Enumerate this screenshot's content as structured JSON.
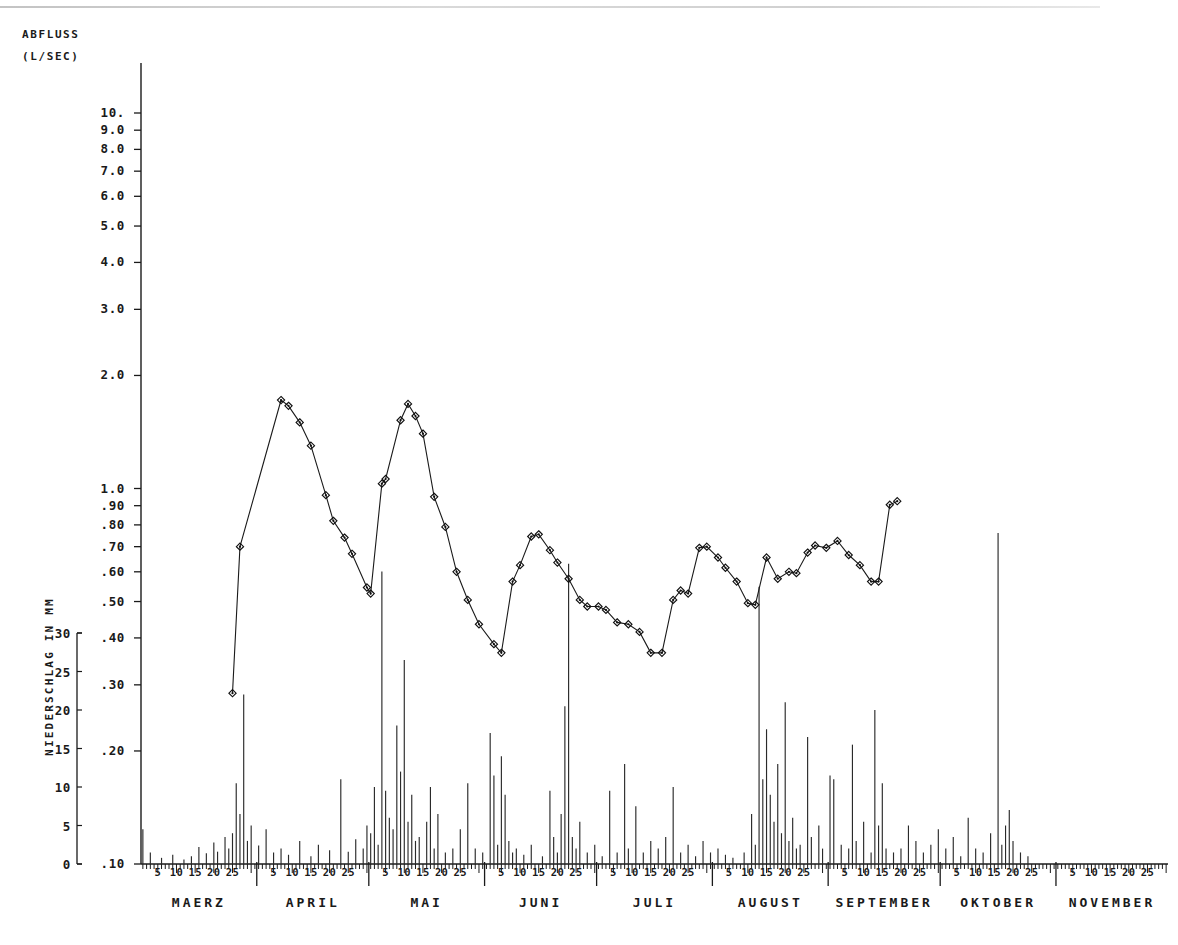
{
  "meta": {
    "kind": "hydrograph",
    "language": "de"
  },
  "axis_titles": {
    "discharge_line1": "ABFLUSS",
    "discharge_line2": "(L/SEC)",
    "precip_label": "NIEDERSCHLAG IN MM"
  },
  "chart_data": {
    "type": "line",
    "subtitle": "",
    "xlabel": "",
    "ylabel": "ABFLUSS (L/SEC)",
    "y2label": "NIEDERSCHLAG IN MM",
    "yscale": "log",
    "ylim": [
      0.1,
      10.0
    ],
    "y2lim": [
      0,
      30
    ],
    "grid": false,
    "legend": "none",
    "y_ticklabels": [
      "10.",
      "9.0",
      "8.0",
      "7.0",
      "6.0",
      "5.0",
      "4.0",
      "3.0",
      "2.0",
      "1.0",
      ".90",
      ".80",
      ".70",
      ".60",
      ".50",
      ".40",
      ".30",
      ".20",
      ".10"
    ],
    "y_tickvalues": [
      10.0,
      9.0,
      8.0,
      7.0,
      6.0,
      5.0,
      4.0,
      3.0,
      2.0,
      1.0,
      0.9,
      0.8,
      0.7,
      0.6,
      0.5,
      0.4,
      0.3,
      0.2,
      0.1
    ],
    "y2_ticklabels": [
      "30",
      "25",
      "20",
      "15",
      "10",
      "5",
      "0"
    ],
    "y2_tickvalues": [
      30,
      25,
      20,
      15,
      10,
      5,
      0
    ],
    "day_ticklabels": [
      "5",
      "10",
      "15",
      "20",
      "25"
    ],
    "months": [
      {
        "name": "MAERZ",
        "days": 31
      },
      {
        "name": "APRIL",
        "days": 30
      },
      {
        "name": "MAI",
        "days": 31
      },
      {
        "name": "JUNI",
        "days": 30
      },
      {
        "name": "JULI",
        "days": 31
      },
      {
        "name": "AUGUST",
        "days": 31
      },
      {
        "name": "SEPTEMBER",
        "days": 30
      },
      {
        "name": "OKTOBER",
        "days": 31
      },
      {
        "name": "NOVEMBER",
        "days": 30
      }
    ],
    "series": [
      {
        "name": "Abfluss",
        "unit": "l/sec",
        "marker": "diamond",
        "points": [
          {
            "day": 25,
            "value": 0.285
          },
          {
            "day": 27,
            "value": 0.7
          },
          {
            "day": 38,
            "value": 1.72
          },
          {
            "day": 40,
            "value": 1.66
          },
          {
            "day": 43,
            "value": 1.5
          },
          {
            "day": 46,
            "value": 1.3
          },
          {
            "day": 50,
            "value": 0.96
          },
          {
            "day": 52,
            "value": 0.82
          },
          {
            "day": 55,
            "value": 0.74
          },
          {
            "day": 57,
            "value": 0.67
          },
          {
            "day": 61,
            "value": 0.545
          },
          {
            "day": 62,
            "value": 0.525
          },
          {
            "day": 65,
            "value": 1.03
          },
          {
            "day": 66,
            "value": 1.06
          },
          {
            "day": 70,
            "value": 1.52
          },
          {
            "day": 72,
            "value": 1.68
          },
          {
            "day": 74,
            "value": 1.56
          },
          {
            "day": 76,
            "value": 1.4
          },
          {
            "day": 79,
            "value": 0.95
          },
          {
            "day": 82,
            "value": 0.79
          },
          {
            "day": 85,
            "value": 0.6
          },
          {
            "day": 88,
            "value": 0.505
          },
          {
            "day": 91,
            "value": 0.435
          },
          {
            "day": 95,
            "value": 0.385
          },
          {
            "day": 97,
            "value": 0.365
          },
          {
            "day": 100,
            "value": 0.565
          },
          {
            "day": 102,
            "value": 0.625
          },
          {
            "day": 105,
            "value": 0.745
          },
          {
            "day": 107,
            "value": 0.755
          },
          {
            "day": 110,
            "value": 0.685
          },
          {
            "day": 112,
            "value": 0.635
          },
          {
            "day": 115,
            "value": 0.575
          },
          {
            "day": 118,
            "value": 0.505
          },
          {
            "day": 120,
            "value": 0.485
          },
          {
            "day": 123,
            "value": 0.485
          },
          {
            "day": 125,
            "value": 0.475
          },
          {
            "day": 128,
            "value": 0.44
          },
          {
            "day": 131,
            "value": 0.435
          },
          {
            "day": 134,
            "value": 0.415
          },
          {
            "day": 137,
            "value": 0.365
          },
          {
            "day": 140,
            "value": 0.365
          },
          {
            "day": 143,
            "value": 0.505
          },
          {
            "day": 145,
            "value": 0.535
          },
          {
            "day": 147,
            "value": 0.525
          },
          {
            "day": 150,
            "value": 0.695
          },
          {
            "day": 152,
            "value": 0.7
          },
          {
            "day": 155,
            "value": 0.655
          },
          {
            "day": 157,
            "value": 0.615
          },
          {
            "day": 160,
            "value": 0.565
          },
          {
            "day": 163,
            "value": 0.495
          },
          {
            "day": 165,
            "value": 0.49
          },
          {
            "day": 168,
            "value": 0.655
          },
          {
            "day": 171,
            "value": 0.575
          },
          {
            "day": 174,
            "value": 0.6
          },
          {
            "day": 176,
            "value": 0.595
          },
          {
            "day": 179,
            "value": 0.675
          },
          {
            "day": 181,
            "value": 0.705
          },
          {
            "day": 184,
            "value": 0.695
          },
          {
            "day": 187,
            "value": 0.725
          },
          {
            "day": 190,
            "value": 0.665
          },
          {
            "day": 193,
            "value": 0.625
          },
          {
            "day": 196,
            "value": 0.565
          },
          {
            "day": 198,
            "value": 0.565
          },
          {
            "day": 201,
            "value": 0.905
          },
          {
            "day": 203,
            "value": 0.925
          }
        ]
      }
    ],
    "precipitation": {
      "name": "Niederschlag",
      "unit": "mm",
      "note": "daily bars; values above 30 mm are drawn beyond the top of the secondary axis",
      "bars": [
        {
          "day": 1,
          "value": 4.5
        },
        {
          "day": 3,
          "value": 1.5
        },
        {
          "day": 6,
          "value": 0.8
        },
        {
          "day": 9,
          "value": 1.2
        },
        {
          "day": 12,
          "value": 0.6
        },
        {
          "day": 14,
          "value": 1.0
        },
        {
          "day": 16,
          "value": 2.2
        },
        {
          "day": 18,
          "value": 1.4
        },
        {
          "day": 20,
          "value": 2.8
        },
        {
          "day": 21,
          "value": 1.6
        },
        {
          "day": 23,
          "value": 3.5
        },
        {
          "day": 24,
          "value": 2.0
        },
        {
          "day": 25,
          "value": 4.0
        },
        {
          "day": 26,
          "value": 10.5
        },
        {
          "day": 27,
          "value": 6.5
        },
        {
          "day": 28,
          "value": 22.0
        },
        {
          "day": 29,
          "value": 3.0
        },
        {
          "day": 30,
          "value": 5.0
        },
        {
          "day": 32,
          "value": 2.4
        },
        {
          "day": 34,
          "value": 4.5
        },
        {
          "day": 36,
          "value": 1.5
        },
        {
          "day": 38,
          "value": 2.0
        },
        {
          "day": 40,
          "value": 1.2
        },
        {
          "day": 43,
          "value": 3.0
        },
        {
          "day": 46,
          "value": 1.0
        },
        {
          "day": 48,
          "value": 2.5
        },
        {
          "day": 51,
          "value": 1.8
        },
        {
          "day": 54,
          "value": 11.0
        },
        {
          "day": 56,
          "value": 1.6
        },
        {
          "day": 58,
          "value": 3.2
        },
        {
          "day": 60,
          "value": 2.0
        },
        {
          "day": 61,
          "value": 5.0
        },
        {
          "day": 62,
          "value": 4.0
        },
        {
          "day": 63,
          "value": 10.0
        },
        {
          "day": 64,
          "value": 2.5
        },
        {
          "day": 65,
          "value": 38.0
        },
        {
          "day": 66,
          "value": 9.5
        },
        {
          "day": 67,
          "value": 6.0
        },
        {
          "day": 68,
          "value": 4.5
        },
        {
          "day": 69,
          "value": 18.0
        },
        {
          "day": 70,
          "value": 12.0
        },
        {
          "day": 71,
          "value": 26.5
        },
        {
          "day": 72,
          "value": 5.5
        },
        {
          "day": 73,
          "value": 9.0
        },
        {
          "day": 74,
          "value": 3.0
        },
        {
          "day": 75,
          "value": 3.5
        },
        {
          "day": 77,
          "value": 5.5
        },
        {
          "day": 78,
          "value": 10.0
        },
        {
          "day": 79,
          "value": 2.0
        },
        {
          "day": 80,
          "value": 6.5
        },
        {
          "day": 82,
          "value": 1.5
        },
        {
          "day": 84,
          "value": 2.0
        },
        {
          "day": 86,
          "value": 4.5
        },
        {
          "day": 88,
          "value": 10.5
        },
        {
          "day": 90,
          "value": 2.0
        },
        {
          "day": 92,
          "value": 1.5
        },
        {
          "day": 94,
          "value": 17.0
        },
        {
          "day": 95,
          "value": 11.5
        },
        {
          "day": 96,
          "value": 2.5
        },
        {
          "day": 97,
          "value": 14.0
        },
        {
          "day": 98,
          "value": 9.0
        },
        {
          "day": 99,
          "value": 3.0
        },
        {
          "day": 100,
          "value": 1.5
        },
        {
          "day": 101,
          "value": 2.0
        },
        {
          "day": 103,
          "value": 1.2
        },
        {
          "day": 105,
          "value": 2.5
        },
        {
          "day": 108,
          "value": 1.0
        },
        {
          "day": 110,
          "value": 9.5
        },
        {
          "day": 111,
          "value": 3.5
        },
        {
          "day": 112,
          "value": 1.5
        },
        {
          "day": 113,
          "value": 6.5
        },
        {
          "day": 114,
          "value": 20.5
        },
        {
          "day": 115,
          "value": 39.0
        },
        {
          "day": 116,
          "value": 3.5
        },
        {
          "day": 117,
          "value": 2.0
        },
        {
          "day": 118,
          "value": 5.5
        },
        {
          "day": 120,
          "value": 1.5
        },
        {
          "day": 122,
          "value": 2.5
        },
        {
          "day": 124,
          "value": 1.0
        },
        {
          "day": 126,
          "value": 9.5
        },
        {
          "day": 128,
          "value": 1.5
        },
        {
          "day": 130,
          "value": 13.0
        },
        {
          "day": 131,
          "value": 2.0
        },
        {
          "day": 133,
          "value": 7.5
        },
        {
          "day": 135,
          "value": 1.5
        },
        {
          "day": 137,
          "value": 3.0
        },
        {
          "day": 139,
          "value": 2.0
        },
        {
          "day": 141,
          "value": 3.5
        },
        {
          "day": 143,
          "value": 10.0
        },
        {
          "day": 145,
          "value": 1.5
        },
        {
          "day": 147,
          "value": 2.5
        },
        {
          "day": 149,
          "value": 1.0
        },
        {
          "day": 151,
          "value": 3.0
        },
        {
          "day": 153,
          "value": 1.5
        },
        {
          "day": 155,
          "value": 2.0
        },
        {
          "day": 157,
          "value": 1.2
        },
        {
          "day": 159,
          "value": 0.8
        },
        {
          "day": 162,
          "value": 1.5
        },
        {
          "day": 164,
          "value": 6.5
        },
        {
          "day": 165,
          "value": 2.5
        },
        {
          "day": 166,
          "value": 36.0
        },
        {
          "day": 167,
          "value": 11.0
        },
        {
          "day": 168,
          "value": 17.5
        },
        {
          "day": 169,
          "value": 9.0
        },
        {
          "day": 170,
          "value": 5.5
        },
        {
          "day": 171,
          "value": 13.0
        },
        {
          "day": 172,
          "value": 4.0
        },
        {
          "day": 173,
          "value": 21.0
        },
        {
          "day": 174,
          "value": 3.0
        },
        {
          "day": 175,
          "value": 6.0
        },
        {
          "day": 176,
          "value": 2.0
        },
        {
          "day": 177,
          "value": 2.5
        },
        {
          "day": 179,
          "value": 16.5
        },
        {
          "day": 180,
          "value": 3.5
        },
        {
          "day": 182,
          "value": 5.0
        },
        {
          "day": 183,
          "value": 2.0
        },
        {
          "day": 185,
          "value": 11.5
        },
        {
          "day": 186,
          "value": 11.0
        },
        {
          "day": 188,
          "value": 2.5
        },
        {
          "day": 190,
          "value": 2.0
        },
        {
          "day": 191,
          "value": 15.5
        },
        {
          "day": 192,
          "value": 3.0
        },
        {
          "day": 194,
          "value": 5.5
        },
        {
          "day": 196,
          "value": 1.5
        },
        {
          "day": 197,
          "value": 20.0
        },
        {
          "day": 198,
          "value": 5.0
        },
        {
          "day": 199,
          "value": 10.5
        },
        {
          "day": 200,
          "value": 2.0
        },
        {
          "day": 202,
          "value": 1.5
        },
        {
          "day": 204,
          "value": 2.0
        },
        {
          "day": 206,
          "value": 5.0
        },
        {
          "day": 208,
          "value": 3.0
        },
        {
          "day": 210,
          "value": 1.5
        },
        {
          "day": 212,
          "value": 2.5
        },
        {
          "day": 214,
          "value": 4.5
        },
        {
          "day": 216,
          "value": 2.0
        },
        {
          "day": 218,
          "value": 3.5
        },
        {
          "day": 220,
          "value": 1.0
        },
        {
          "day": 222,
          "value": 6.0
        },
        {
          "day": 224,
          "value": 2.0
        },
        {
          "day": 226,
          "value": 1.5
        },
        {
          "day": 228,
          "value": 4.0
        },
        {
          "day": 230,
          "value": 43.0
        },
        {
          "day": 231,
          "value": 2.5
        },
        {
          "day": 232,
          "value": 5.0
        },
        {
          "day": 233,
          "value": 7.0
        },
        {
          "day": 234,
          "value": 3.0
        },
        {
          "day": 236,
          "value": 1.5
        },
        {
          "day": 238,
          "value": 1.0
        }
      ]
    }
  }
}
